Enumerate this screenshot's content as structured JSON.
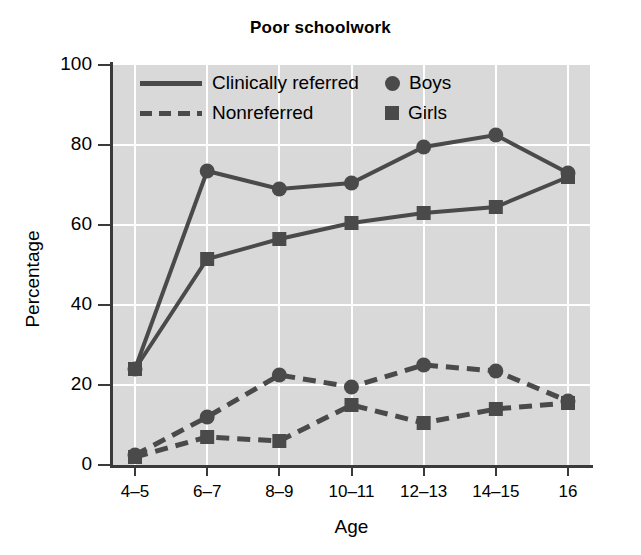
{
  "chart_data": {
    "type": "line",
    "title": "Poor schoolwork",
    "xlabel": "Age",
    "ylabel": "Percentage",
    "categories": [
      "4–5",
      "6–7",
      "8–9",
      "10–11",
      "12–13",
      "14–15",
      "16"
    ],
    "ylim": [
      0,
      100
    ],
    "yticks": [
      0,
      20,
      40,
      60,
      80,
      100
    ],
    "ytick_labels": [
      "0",
      "20",
      "40",
      "60",
      "80",
      "100"
    ],
    "grid": true,
    "legend_position": "top-inside",
    "series": [
      {
        "name": "Clinically referred – Boys",
        "group": "Clinically referred",
        "sex": "Boys",
        "style": "solid",
        "marker": "circle",
        "values": [
          24,
          73.5,
          69,
          70.5,
          79.5,
          82.5,
          73
        ]
      },
      {
        "name": "Clinically referred – Girls",
        "group": "Clinically referred",
        "sex": "Girls",
        "style": "solid",
        "marker": "square",
        "values": [
          24,
          51.5,
          56.5,
          60.5,
          63,
          64.5,
          72
        ]
      },
      {
        "name": "Nonreferred – Boys",
        "group": "Nonreferred",
        "sex": "Boys",
        "style": "dashed",
        "marker": "circle",
        "values": [
          2.5,
          12,
          22.5,
          19.5,
          25,
          23.5,
          16
        ]
      },
      {
        "name": "Nonreferred – Girls",
        "group": "Nonreferred",
        "sex": "Girls",
        "style": "dashed",
        "marker": "square",
        "values": [
          2,
          7,
          6,
          15,
          10.5,
          14,
          15.5
        ]
      }
    ],
    "legend": {
      "line_entries": [
        {
          "label": "Clinically referred",
          "style": "solid"
        },
        {
          "label": "Nonreferred",
          "style": "dashed"
        }
      ],
      "marker_entries": [
        {
          "label": "Boys",
          "marker": "circle"
        },
        {
          "label": "Girls",
          "marker": "square"
        }
      ]
    },
    "colors": {
      "series": "#4a4a4a",
      "plot_background": "#d9d9d9",
      "gridlines": "#ffffff",
      "axis": "#3a3a3a",
      "text": "#000000"
    }
  }
}
